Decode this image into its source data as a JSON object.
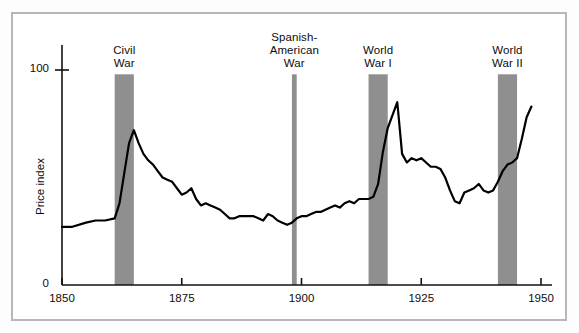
{
  "chart_data": {
    "type": "line",
    "title": "",
    "xlabel": "",
    "ylabel": "Price index",
    "xlim": [
      1850,
      1950
    ],
    "ylim": [
      0,
      107
    ],
    "grid": false,
    "legend": "none",
    "y_ticks": [
      {
        "value": 0,
        "label": "0"
      },
      {
        "value": 100,
        "label": "100"
      }
    ],
    "x_ticks": [
      {
        "value": 1850,
        "label": "1850"
      },
      {
        "value": 1875,
        "label": "1875"
      },
      {
        "value": 1900,
        "label": "1900"
      },
      {
        "value": 1925,
        "label": "1925"
      },
      {
        "value": 1950,
        "label": "1950"
      }
    ],
    "shaded_bands": [
      {
        "name": "Civil War",
        "label_lines": [
          "Civil",
          "War"
        ],
        "start": 1861,
        "end": 1865,
        "top_value": 98
      },
      {
        "name": "Spanish-American War",
        "label_lines": [
          "Spanish-",
          "American",
          "War"
        ],
        "start": 1898,
        "end": 1899,
        "top_value": 98
      },
      {
        "name": "World War I",
        "label_lines": [
          "World",
          "War I"
        ],
        "start": 1914,
        "end": 1918,
        "top_value": 98
      },
      {
        "name": "World War II",
        "label_lines": [
          "World",
          "War II"
        ],
        "start": 1941,
        "end": 1945,
        "top_value": 98
      }
    ],
    "series": [
      {
        "name": "Price index",
        "x": [
          1850,
          1852,
          1855,
          1857,
          1859,
          1861,
          1862,
          1863,
          1864,
          1865,
          1866,
          1867,
          1868,
          1869,
          1870,
          1871,
          1872,
          1873,
          1874,
          1875,
          1876,
          1877,
          1878,
          1879,
          1880,
          1881,
          1882,
          1883,
          1884,
          1885,
          1886,
          1887,
          1888,
          1889,
          1890,
          1891,
          1892,
          1893,
          1894,
          1895,
          1896,
          1897,
          1898,
          1899,
          1900,
          1901,
          1902,
          1903,
          1904,
          1905,
          1906,
          1907,
          1908,
          1909,
          1910,
          1911,
          1912,
          1913,
          1914,
          1915,
          1916,
          1917,
          1918,
          1919,
          1920,
          1921,
          1922,
          1923,
          1924,
          1925,
          1926,
          1927,
          1928,
          1929,
          1930,
          1931,
          1932,
          1933,
          1934,
          1935,
          1936,
          1937,
          1938,
          1939,
          1940,
          1941,
          1942,
          1943,
          1944,
          1945,
          1946,
          1947,
          1948
        ],
        "y": [
          27,
          27,
          29,
          30,
          30,
          31,
          38,
          52,
          66,
          72,
          66,
          61,
          58,
          56,
          53,
          50,
          49,
          48,
          45,
          42,
          43,
          45,
          40,
          37,
          38,
          37,
          36,
          35,
          33,
          31,
          31,
          32,
          32,
          32,
          32,
          31,
          30,
          33,
          32,
          30,
          29,
          28,
          29,
          31,
          32,
          32,
          33,
          34,
          34,
          35,
          36,
          37,
          36,
          38,
          39,
          38,
          40,
          40,
          40,
          41,
          47,
          62,
          73,
          79,
          85,
          61,
          57,
          59,
          58,
          59,
          57,
          55,
          55,
          54,
          50,
          44,
          39,
          38,
          43,
          44,
          45,
          47,
          44,
          43,
          44,
          48,
          53,
          56,
          57,
          59,
          68,
          78,
          83
        ]
      }
    ]
  }
}
